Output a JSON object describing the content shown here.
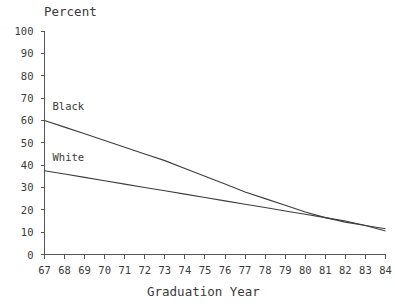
{
  "chart_data": {
    "type": "line",
    "title": "",
    "ylabel": "Percent",
    "xlabel": "Graduation Year",
    "ylim": [
      0,
      100
    ],
    "xlim": [
      67,
      84
    ],
    "ytick_labels": [
      "0",
      "10",
      "20",
      "30",
      "40",
      "50",
      "60",
      "70",
      "80",
      "90",
      "100"
    ],
    "ytick_values": [
      0,
      10,
      20,
      30,
      40,
      50,
      60,
      70,
      80,
      90,
      100
    ],
    "xtick_labels": [
      "67",
      "68",
      "69",
      "70",
      "71",
      "72",
      "73",
      "74",
      "75",
      "76",
      "77",
      "78",
      "79",
      "80",
      "81",
      "82",
      "83",
      "84"
    ],
    "xtick_values": [
      67,
      68,
      69,
      70,
      71,
      72,
      73,
      74,
      75,
      76,
      77,
      78,
      79,
      80,
      81,
      82,
      83,
      84
    ],
    "x": [
      67,
      68,
      69,
      70,
      71,
      72,
      73,
      74,
      75,
      76,
      77,
      78,
      79,
      80,
      81,
      82,
      83,
      84
    ],
    "grid": false,
    "legend_position": "inline-labels",
    "series": [
      {
        "name": "Black",
        "label": "Black",
        "color": "#3d3d3d",
        "values": [
          60.0,
          57.0,
          54.0,
          51.0,
          48.0,
          45.0,
          42.0,
          38.5,
          35.0,
          31.5,
          28.0,
          25.0,
          22.0,
          19.0,
          16.5,
          14.5,
          13.0,
          11.5
        ]
      },
      {
        "name": "White",
        "label": "White",
        "color": "#3d3d3d",
        "values": [
          37.5,
          36.0,
          34.5,
          33.0,
          31.5,
          30.0,
          28.5,
          27.0,
          25.5,
          24.0,
          22.5,
          21.0,
          19.5,
          18.0,
          16.5,
          15.0,
          13.0,
          10.5
        ]
      }
    ],
    "annotations": [
      {
        "text": "Black",
        "x": 67.3,
        "y": 66.0
      },
      {
        "text": "White",
        "x": 67.3,
        "y": 43.0
      }
    ]
  }
}
